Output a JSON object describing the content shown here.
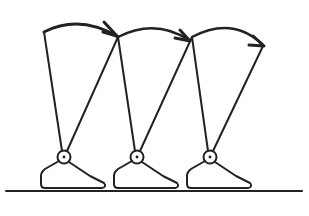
{
  "diagram": {
    "type": "gait-cycle-schematic",
    "stroke_color": "#222222",
    "background": "#ffffff",
    "ground": {
      "x1": 6,
      "x2": 302,
      "y": 191
    },
    "steps": [
      {
        "ankle": {
          "x": 64,
          "y": 157
        },
        "hip_back": {
          "x": 44,
          "y": 32
        },
        "hip_front": {
          "x": 118,
          "y": 37
        }
      },
      {
        "ankle": {
          "x": 137,
          "y": 157
        },
        "hip_back": {
          "x": 118,
          "y": 37
        },
        "hip_front": {
          "x": 192,
          "y": 37
        }
      },
      {
        "ankle": {
          "x": 210,
          "y": 157
        },
        "hip_back": {
          "x": 192,
          "y": 37
        },
        "hip_front": {
          "x": 263,
          "y": 46
        }
      }
    ],
    "arcs": [
      {
        "from": "hip-1",
        "to": "hip-2",
        "arrow": true
      },
      {
        "from": "hip-2",
        "to": "hip-3",
        "arrow": true
      },
      {
        "from": "hip-3",
        "to": "hip-4",
        "arrow": true
      }
    ]
  }
}
